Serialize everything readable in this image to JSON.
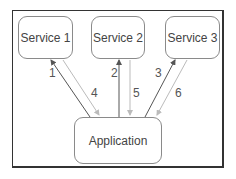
{
  "diagram": {
    "nodes": {
      "service1": "Service 1",
      "service2": "Service 2",
      "service3": "Service 3",
      "application": "Application"
    },
    "edges": [
      {
        "label": "1",
        "from": "Application",
        "to": "Service 1",
        "style": "dark"
      },
      {
        "label": "2",
        "from": "Application",
        "to": "Service 2",
        "style": "dark"
      },
      {
        "label": "3",
        "from": "Application",
        "to": "Service 3",
        "style": "dark"
      },
      {
        "label": "4",
        "from": "Service 1",
        "to": "Application",
        "style": "light"
      },
      {
        "label": "5",
        "from": "Service 2",
        "to": "Application",
        "style": "light"
      },
      {
        "label": "6",
        "from": "Service 3",
        "to": "Application",
        "style": "light"
      }
    ],
    "colors": {
      "request_arrow": "#555555",
      "response_arrow": "#bbbbbb",
      "frame": "#333333"
    }
  }
}
